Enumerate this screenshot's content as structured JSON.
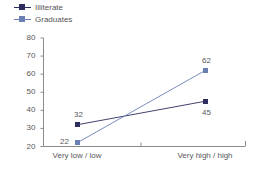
{
  "chart_data": {
    "type": "line",
    "title": "",
    "xlabel": "",
    "ylabel": "",
    "categories": [
      "Very low / low",
      "Very high / high"
    ],
    "ylim": [
      20,
      80
    ],
    "yticks": [
      20,
      30,
      40,
      50,
      60,
      70,
      80
    ],
    "ytick_labels": [
      "20",
      "30",
      "40",
      "50",
      "60",
      "70",
      "80"
    ],
    "grid": false,
    "legend_position": "top-left",
    "series": [
      {
        "name": "Illiterate",
        "color": "#2d2d5e",
        "values": [
          32,
          45
        ],
        "point_labels": [
          "32",
          "45"
        ]
      },
      {
        "name": "Graduates",
        "color": "#6b7fb5",
        "values": [
          22,
          62
        ],
        "point_labels": [
          "22",
          "62"
        ]
      }
    ]
  },
  "legend": {
    "items": [
      {
        "label": "Illiterate",
        "color": "#2d2d5e"
      },
      {
        "label": "Graduates",
        "color": "#6b7fb5"
      }
    ]
  },
  "axis": {
    "y_labels": [
      "80",
      "70",
      "60",
      "50",
      "40",
      "30",
      "20"
    ],
    "x_labels": [
      "Very low / low",
      "Very high / high"
    ]
  },
  "point_labels": {
    "illiterate_low": "32",
    "illiterate_high": "45",
    "graduates_low": "22",
    "graduates_high": "62"
  }
}
